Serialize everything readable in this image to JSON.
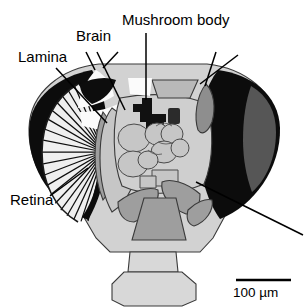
{
  "figure": {
    "kind": "anatomical-cross-section",
    "background_color": "#ffffff",
    "labels": [
      {
        "id": "lamina",
        "text": "Lamina",
        "x": 18,
        "y": 62,
        "anchor": "start"
      },
      {
        "id": "brain",
        "text": "Brain",
        "x": 76,
        "y": 41,
        "anchor": "start"
      },
      {
        "id": "mushroom_body",
        "text": "Mushroom body",
        "x": 122,
        "y": 25,
        "anchor": "start"
      },
      {
        "id": "retina",
        "text": "Retina",
        "x": 10,
        "y": 205,
        "anchor": "start"
      }
    ],
    "scale_bar": {
      "text": "100 µm",
      "value": 100,
      "unit": "µm",
      "bar_x1": 236,
      "bar_x2": 291,
      "bar_y": 280,
      "text_x": 233,
      "text_y": 297
    },
    "leader_lines": [
      {
        "id": "leader-lamina",
        "points": "56,68 107,123"
      },
      {
        "id": "leader-brain",
        "points": "97,52 125,110"
      },
      {
        "id": "leader-brain-extra-1",
        "points": "86,52 95,70"
      },
      {
        "id": "leader-brain-extra-2",
        "points": "118,52 103,68"
      },
      {
        "id": "leader-mushroom-body",
        "points": "146,33 146,100"
      },
      {
        "id": "leader-right-upper-1",
        "points": "216,52 205,86"
      },
      {
        "id": "leader-right-upper-2",
        "points": "238,55 200,84"
      },
      {
        "id": "leader-right-lower",
        "points": "303,235 196,182"
      }
    ],
    "colors": {
      "eye_dark": "#0c0c0c",
      "eye_inner_gray": "#565656",
      "head_capsule": "#d2d2d2",
      "brain_light": "#cfcfcf",
      "neuropil_gray": "#9e9e9e",
      "air_sac_white": "#fbfbfb",
      "mushroom_body_black": "#111111",
      "outline": "#3a3a3a",
      "text": "#000000"
    },
    "structures": [
      {
        "id": "right-compound-eye",
        "name": "right compound eye",
        "fill": "#0c0c0c"
      },
      {
        "id": "right-eye-inner",
        "name": "right eye inner crescent",
        "fill": "#565656"
      },
      {
        "id": "left-compound-eye",
        "name": "left compound eye",
        "fill": "#0c0c0c"
      },
      {
        "id": "retina-ommatidia",
        "name": "retina ommatidial array",
        "fill": "striped"
      },
      {
        "id": "lamina-band",
        "name": "lamina",
        "fill": "#9e9e9e"
      },
      {
        "id": "medulla",
        "name": "medulla",
        "fill": "#c2c2c2"
      },
      {
        "id": "central-brain",
        "name": "central brain neuropil",
        "fill": "#cfcfcf"
      },
      {
        "id": "mushroom-body",
        "name": "mushroom body",
        "fill": "#111111"
      },
      {
        "id": "antennal-lobe-left",
        "name": "left antennal lobe",
        "fill": "#9e9e9e"
      },
      {
        "id": "antennal-lobe-right",
        "name": "right antennal lobe",
        "fill": "#9e9e9e"
      },
      {
        "id": "subesophageal",
        "name": "subesophageal ganglion",
        "fill": "#9e9e9e"
      },
      {
        "id": "ocellar-tract",
        "name": "ocellar / antennal nerve",
        "fill": "#8e8e8e"
      },
      {
        "id": "neck",
        "name": "neck",
        "fill": "#d8d8d8"
      },
      {
        "id": "proboscis",
        "name": "proboscis",
        "fill": "#d8d8d8"
      }
    ]
  }
}
